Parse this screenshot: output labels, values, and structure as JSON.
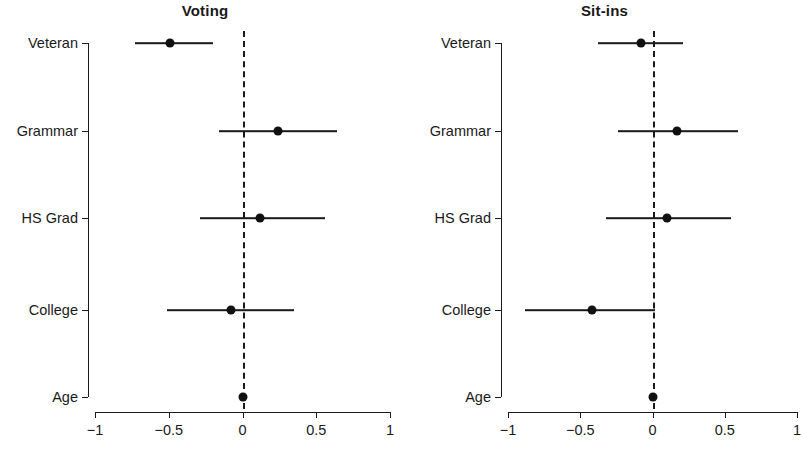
{
  "figure": {
    "width": 799,
    "height": 463,
    "background": "#ffffff",
    "ink_color": "#1a1a1a"
  },
  "chart_data": [
    {
      "type": "scatter",
      "subtype": "coefficient-plot",
      "title": "Voting",
      "xlabel": "",
      "ylabel": "",
      "xlim": [
        -1,
        1
      ],
      "xticks": [
        -1,
        -0.5,
        0,
        0.5,
        1
      ],
      "xticklabels": [
        "-1",
        "-0.5",
        "0",
        "0.5",
        "1"
      ],
      "categories": [
        "Veteran",
        "Grammar",
        "HS Grad",
        "College",
        "Age"
      ],
      "grid": false,
      "legend": "none",
      "reference_line": {
        "value": 0,
        "style": "dashed"
      },
      "points": [
        {
          "label": "Veteran",
          "estimate": -0.49,
          "ci_low": -0.73,
          "ci_high": -0.2
        },
        {
          "label": "Grammar",
          "estimate": 0.24,
          "ci_low": -0.16,
          "ci_high": 0.64
        },
        {
          "label": "HS Grad",
          "estimate": 0.12,
          "ci_low": -0.29,
          "ci_high": 0.56
        },
        {
          "label": "College",
          "estimate": -0.08,
          "ci_low": -0.51,
          "ci_high": 0.35
        },
        {
          "label": "Age",
          "estimate": 0.0,
          "ci_low": -0.01,
          "ci_high": 0.01
        }
      ]
    },
    {
      "type": "scatter",
      "subtype": "coefficient-plot",
      "title": "Sit-ins",
      "xlabel": "",
      "ylabel": "",
      "xlim": [
        -1,
        1
      ],
      "xticks": [
        -1,
        -0.5,
        0,
        0.5,
        1
      ],
      "xticklabels": [
        "-1",
        "-0.5",
        "0",
        "0.5",
        "1"
      ],
      "categories": [
        "Veteran",
        "Grammar",
        "HS Grad",
        "College",
        "Age"
      ],
      "grid": false,
      "legend": "none",
      "reference_line": {
        "value": 0,
        "style": "dashed"
      },
      "points": [
        {
          "label": "Veteran",
          "estimate": -0.08,
          "ci_low": -0.38,
          "ci_high": 0.21
        },
        {
          "label": "Grammar",
          "estimate": 0.17,
          "ci_low": -0.24,
          "ci_high": 0.59
        },
        {
          "label": "HS Grad",
          "estimate": 0.1,
          "ci_low": -0.32,
          "ci_high": 0.54
        },
        {
          "label": "College",
          "estimate": -0.42,
          "ci_low": -0.88,
          "ci_high": 0.02
        },
        {
          "label": "Age",
          "estimate": 0.0,
          "ci_low": -0.01,
          "ci_high": 0.01
        }
      ]
    }
  ]
}
